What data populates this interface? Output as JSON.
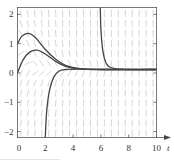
{
  "chart_data": {
    "type": "line",
    "title": "",
    "xlabel": "t",
    "ylabel": "",
    "xlim": [
      0,
      10
    ],
    "ylim": [
      -2.2,
      2.3
    ],
    "x_ticks": [
      "0",
      "2",
      "4",
      "6",
      "8",
      "10"
    ],
    "y_ticks": [
      "2",
      "1",
      "0",
      "−1",
      "−2"
    ],
    "grid": false,
    "legend": null,
    "background": "slope field (direction field) of light gray short segments",
    "equilibrium_value": 0.12,
    "series": [
      {
        "name": "solution-from-y1",
        "points": [
          [
            0,
            1.0
          ],
          [
            0.3,
            1.25
          ],
          [
            0.8,
            1.35
          ],
          [
            1.3,
            1.2
          ],
          [
            2.0,
            0.8
          ],
          [
            2.8,
            0.45
          ],
          [
            3.5,
            0.25
          ],
          [
            4.5,
            0.15
          ],
          [
            6,
            0.12
          ],
          [
            10,
            0.12
          ]
        ]
      },
      {
        "name": "solution-from-y0",
        "points": [
          [
            0,
            0.0
          ],
          [
            0.4,
            0.45
          ],
          [
            0.9,
            0.72
          ],
          [
            1.4,
            0.78
          ],
          [
            2.0,
            0.65
          ],
          [
            2.8,
            0.38
          ],
          [
            3.5,
            0.22
          ],
          [
            4.5,
            0.14
          ],
          [
            6,
            0.12
          ],
          [
            10,
            0.12
          ]
        ]
      },
      {
        "name": "solution-from-below",
        "points": [
          [
            2.0,
            -2.2
          ],
          [
            2.1,
            -1.3
          ],
          [
            2.3,
            -0.6
          ],
          [
            2.6,
            -0.15
          ],
          [
            3.0,
            0.07
          ],
          [
            3.5,
            0.12
          ],
          [
            4.5,
            0.13
          ],
          [
            6,
            0.12
          ],
          [
            10,
            0.12
          ]
        ]
      },
      {
        "name": "solution-from-above",
        "points": [
          [
            5.95,
            2.3
          ],
          [
            6.0,
            1.5
          ],
          [
            6.1,
            0.9
          ],
          [
            6.25,
            0.5
          ],
          [
            6.5,
            0.25
          ],
          [
            7.0,
            0.15
          ],
          [
            8.0,
            0.12
          ],
          [
            10,
            0.12
          ]
        ]
      }
    ]
  },
  "colors": {
    "curve": "#444444",
    "field": "#c4c4c4",
    "axis": "#555555"
  }
}
